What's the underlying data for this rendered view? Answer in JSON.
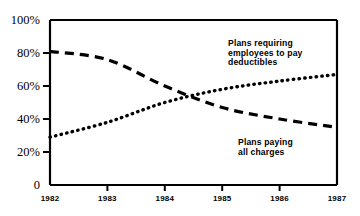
{
  "chart_data": {
    "type": "line",
    "title": "",
    "subtitle": "",
    "xlabel": "",
    "ylabel": "",
    "x": [
      1982,
      1983,
      1984,
      1985,
      1986,
      1987
    ],
    "xlim": [
      1982,
      1987
    ],
    "ylim": [
      0,
      100
    ],
    "grid": false,
    "legend_position": "inline-annotations",
    "y_tick_labels": [
      "100%",
      "80%",
      "60%",
      "40%",
      "20%",
      "0"
    ],
    "y_tick_values": [
      100,
      80,
      60,
      40,
      20,
      0
    ],
    "x_tick_labels": [
      "1982",
      "1983",
      "1984",
      "1985",
      "1986",
      "1987"
    ],
    "series": [
      {
        "name": "Plans requiring employees to pay deductibles",
        "style": "dotted",
        "values": [
          29,
          38,
          50,
          58,
          63,
          67
        ]
      },
      {
        "name": "Plans paying all charges",
        "style": "dashed",
        "values": [
          81,
          76,
          60,
          47,
          40,
          35
        ]
      }
    ],
    "annotations": [
      {
        "id": "deductibles-label",
        "lines": [
          "Plans requiring",
          "employees to pay",
          "deductibles"
        ],
        "x": 228,
        "y": 46
      },
      {
        "id": "all-charges-label",
        "lines": [
          "Plans paying",
          "all charges"
        ],
        "x": 238,
        "y": 145
      }
    ]
  },
  "colors": {
    "ink": "#000000",
    "background": "#ffffff"
  }
}
